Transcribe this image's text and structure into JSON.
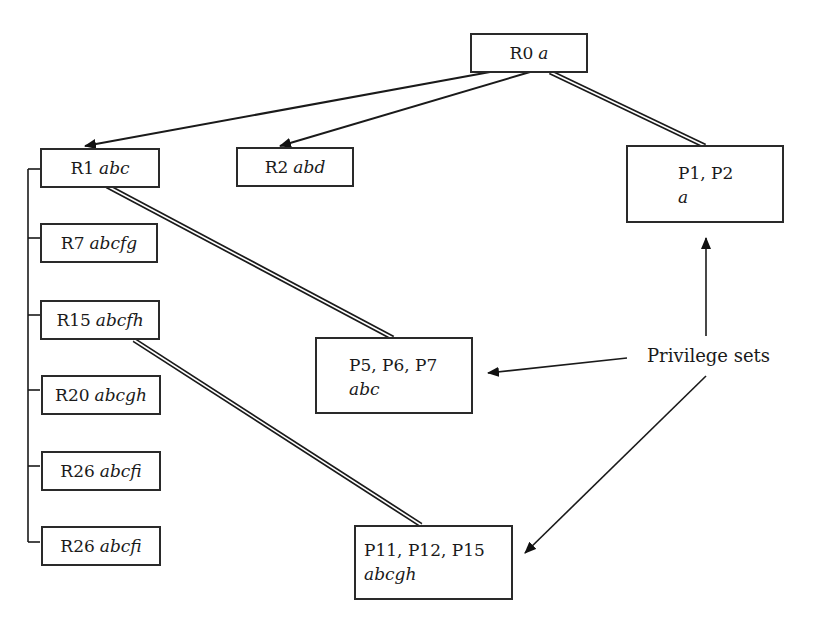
{
  "diagram": {
    "roles": [
      {
        "id": "R0",
        "label": "R0",
        "privs": "a"
      },
      {
        "id": "R1",
        "label": "R1",
        "privs": "abc"
      },
      {
        "id": "R2",
        "label": "R2",
        "privs": "abd"
      },
      {
        "id": "R7",
        "label": "R7",
        "privs": "abcfg"
      },
      {
        "id": "R15",
        "label": "R15",
        "privs": "abcfh"
      },
      {
        "id": "R20",
        "label": "R20",
        "privs": "abcgh"
      },
      {
        "id": "R26a",
        "label": "R26",
        "privs": "abcfi"
      },
      {
        "id": "R26b",
        "label": "R26",
        "privs": "abcfi"
      }
    ],
    "privilege_sets": [
      {
        "id": "PS1",
        "label": "P1, P2",
        "privs": "a"
      },
      {
        "id": "PS2",
        "label": "P5, P6, P7",
        "privs": "abc"
      },
      {
        "id": "PS3",
        "label": "P11, P12, P15",
        "privs": "abcgh"
      }
    ],
    "annotation": "Privilege sets",
    "edges": [
      {
        "from": "R0",
        "to": "R1",
        "type": "arrow"
      },
      {
        "from": "R0",
        "to": "R2",
        "type": "arrow"
      },
      {
        "from": "R0",
        "to": "PS1",
        "type": "double-line"
      },
      {
        "from": "R1",
        "to": "PS2",
        "type": "double-line"
      },
      {
        "from": "R15",
        "to": "PS3",
        "type": "double-line"
      },
      {
        "from": "R1",
        "to": [
          "R7",
          "R15",
          "R20",
          "R26a",
          "R26b"
        ],
        "type": "tree-bracket"
      },
      {
        "from": "annotation",
        "to": "PS1",
        "type": "arrow"
      },
      {
        "from": "annotation",
        "to": "PS2",
        "type": "arrow"
      },
      {
        "from": "annotation",
        "to": "PS3",
        "type": "arrow"
      }
    ]
  }
}
